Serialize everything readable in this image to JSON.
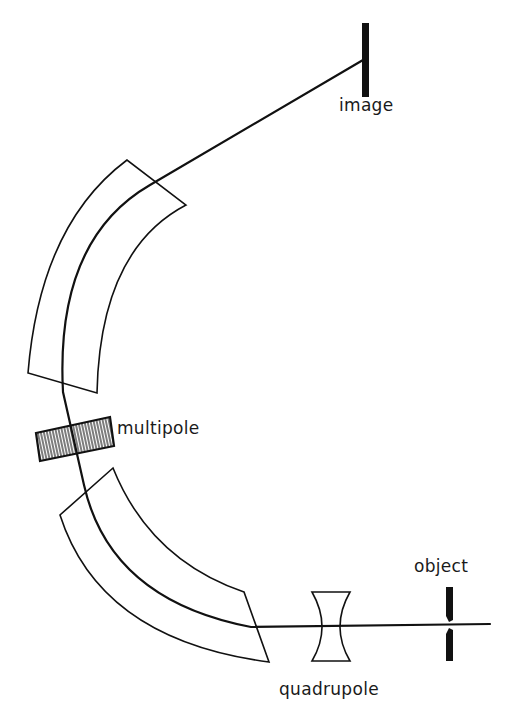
{
  "diagram": {
    "type": "ion-optical spectrometer beam path schematic",
    "labels": {
      "image": "image",
      "multipole": "multipole",
      "object": "object",
      "quadrupole": "quadrupole"
    },
    "components": [
      {
        "name": "object",
        "kind": "slit"
      },
      {
        "name": "quadrupole",
        "kind": "lens"
      },
      {
        "name": "lower-sector-magnet",
        "kind": "bending-magnet"
      },
      {
        "name": "multipole",
        "kind": "corrector"
      },
      {
        "name": "upper-sector-magnet",
        "kind": "bending-magnet"
      },
      {
        "name": "image",
        "kind": "detector-plane"
      }
    ],
    "colors": {
      "line": "#111111",
      "background": "#ffffff"
    }
  }
}
